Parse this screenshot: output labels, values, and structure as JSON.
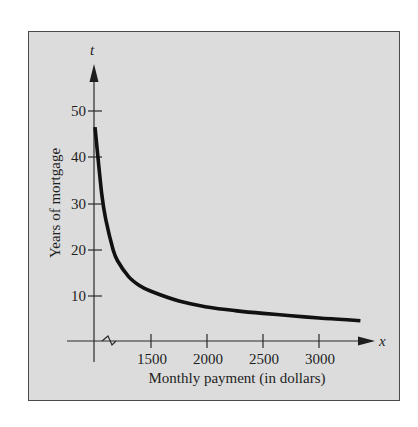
{
  "chart_data": {
    "type": "line",
    "title": "",
    "xlabel": "Monthly payment (in dollars)",
    "ylabel": "Years of mortgage",
    "x_axis_variable": "x",
    "y_axis_variable": "t",
    "x_ticks": [
      "1500",
      "2000",
      "2500",
      "3000"
    ],
    "y_ticks": [
      "10",
      "20",
      "30",
      "40",
      "50"
    ],
    "x_axis_break": true,
    "xlim": [
      1000,
      3500
    ],
    "ylim": [
      0,
      55
    ],
    "grid": false,
    "legend": null,
    "series": [
      {
        "name": "Years of mortgage vs monthly payment",
        "x": [
          1000,
          1060,
          1100,
          1160,
          1200,
          1300,
          1400,
          1500,
          1750,
          2000,
          2250,
          2500,
          2750,
          3000,
          3250,
          3370
        ],
        "y": [
          46.5,
          32,
          26,
          20,
          17.5,
          14,
          12,
          10.8,
          8.7,
          7.4,
          6.6,
          6.0,
          5.5,
          5.0,
          4.6,
          4.4
        ]
      }
    ]
  },
  "labels": {
    "xlabel": "Monthly payment (in dollars)",
    "ylabel": "Years of mortgage",
    "x_var": "x",
    "y_var": "t",
    "x_ticks": [
      "1500",
      "2000",
      "2500",
      "3000"
    ],
    "y_ticks": [
      "10",
      "20",
      "30",
      "40",
      "50"
    ]
  }
}
